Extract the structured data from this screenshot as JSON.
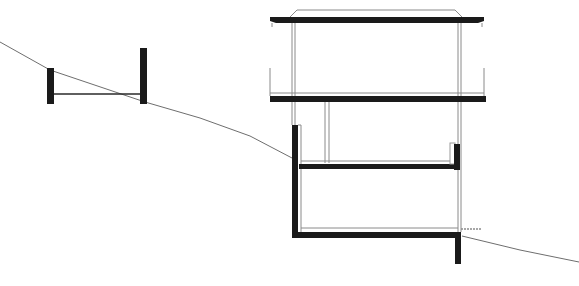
{
  "diagram": {
    "type": "architectural-section",
    "background": "#ffffff",
    "colors": {
      "solid": "#1a1a1a",
      "thin_line": "#8a8a8a",
      "ground": "#6e6e6e"
    },
    "ground_line": "0,42 50,70 145,102 200,118 250,136 292,158",
    "ground_line_right": "462,236 520,250 579,262",
    "left_structure": {
      "left_post": {
        "x": 47,
        "y": 68,
        "w": 7,
        "h": 36
      },
      "right_post": {
        "x": 140,
        "y": 48,
        "w": 7,
        "h": 56
      },
      "beam_y": 94
    },
    "building": {
      "roof": {
        "x": 270,
        "y": 17,
        "w": 214,
        "h": 6
      },
      "roof_parapet": "290,17 297,10 455,10 462,17",
      "upper_slab": {
        "x": 270,
        "y": 96,
        "w": 216,
        "h": 6
      },
      "mid_slab": {
        "x": 299,
        "y": 164,
        "w": 156,
        "h": 5
      },
      "lower_slab": {
        "x": 292,
        "y": 232,
        "w": 169,
        "h": 6
      },
      "left_wall": {
        "x": 292,
        "y": 125,
        "w": 6,
        "h": 113
      },
      "right_stub": {
        "x": 454,
        "y": 144,
        "w": 6,
        "h": 26
      },
      "right_footing": {
        "x": 455,
        "y": 232,
        "w": 6,
        "h": 32
      }
    }
  }
}
